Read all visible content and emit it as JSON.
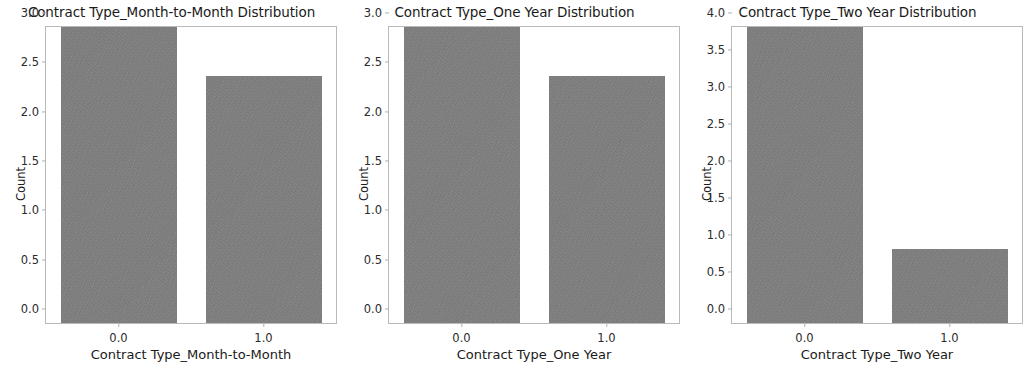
{
  "figure": {
    "background": "#ffffff",
    "bar_color": "#808080",
    "spine_color": "#b9b9b9",
    "tick_color": "#b0b0b0"
  },
  "chart_data": [
    {
      "type": "bar",
      "title": "Contract Type_Month-to-Month Distribution",
      "xlabel": "Contract Type_Month-to-Month",
      "ylabel": "Count",
      "categories": [
        "0.0",
        "1.0"
      ],
      "values": [
        3.0,
        2.5
      ],
      "xticks": [
        "0.0",
        "1.0"
      ],
      "yticks": [
        "0.0",
        "0.5",
        "1.0",
        "1.5",
        "2.0",
        "2.5",
        "3.0"
      ],
      "ylim": [
        0,
        3.0
      ],
      "grid": false,
      "legend": false
    },
    {
      "type": "bar",
      "title": "Contract Type_One Year Distribution",
      "xlabel": "Contract Type_One Year",
      "ylabel": "Count",
      "categories": [
        "0.0",
        "1.0"
      ],
      "values": [
        3.0,
        2.5
      ],
      "xticks": [
        "0.0",
        "1.0"
      ],
      "yticks": [
        "0.0",
        "0.5",
        "1.0",
        "1.5",
        "2.0",
        "2.5",
        "3.0"
      ],
      "ylim": [
        0,
        3.0
      ],
      "grid": false,
      "legend": false
    },
    {
      "type": "bar",
      "title": "Contract Type_Two Year Distribution",
      "xlabel": "Contract Type_Two Year",
      "ylabel": "Count",
      "categories": [
        "0.0",
        "1.0"
      ],
      "values": [
        4.0,
        1.0
      ],
      "xticks": [
        "0.0",
        "1.0"
      ],
      "yticks": [
        "0.0",
        "0.5",
        "1.0",
        "1.5",
        "2.0",
        "2.5",
        "3.0",
        "3.5",
        "4.0"
      ],
      "ylim": [
        0,
        4.0
      ],
      "grid": false,
      "legend": false
    }
  ]
}
